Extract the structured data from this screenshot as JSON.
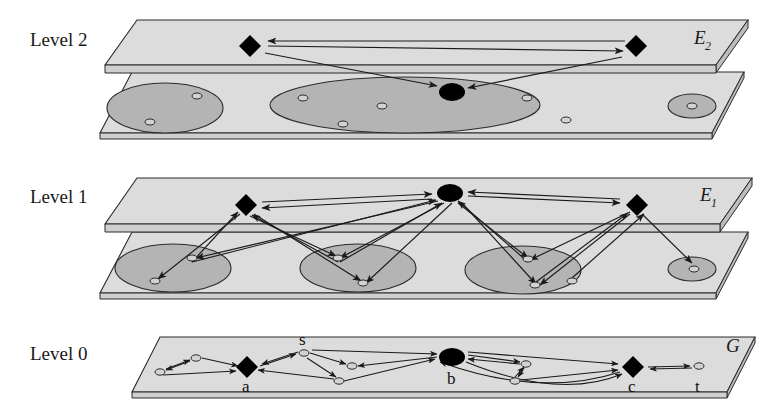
{
  "figure": {
    "kind": "hierarchical-graph-abstraction-diagram",
    "background": "#ffffff",
    "ink": "#1a1a1a"
  },
  "palette": {
    "plane_top": "#dcdcdc",
    "plane_side": "#bdbdbd",
    "plane_edge": "#2b2b2b",
    "cluster_fill": "#b4b4b4",
    "cluster_edge": "#2b2b2b",
    "node_fill": "#000000",
    "small_node_fill": "#d2d2d2",
    "arrow": "#1a1a1a"
  },
  "levels": [
    {
      "id": "level2",
      "label": "Level 2",
      "label_x": 30,
      "label_y": 46,
      "set_label": "E",
      "set_subscript": "2",
      "set_label_x": 694,
      "set_label_y": 44
    },
    {
      "id": "level1",
      "label": "Level 1",
      "label_x": 30,
      "label_y": 203,
      "set_label": "E",
      "set_subscript": "1",
      "set_label_x": 700,
      "set_label_y": 201
    },
    {
      "id": "level0",
      "label": "Level 0",
      "label_x": 30,
      "label_y": 360,
      "set_label": "G",
      "set_subscript": "",
      "set_label_x": 726,
      "set_label_y": 352
    }
  ],
  "node_labels": [
    {
      "text": "a",
      "x": 247,
      "y": 389
    },
    {
      "text": "s",
      "x": 303,
      "y": 340
    },
    {
      "text": "b",
      "x": 452,
      "y": 389
    },
    {
      "text": "c",
      "x": 633,
      "y": 389
    },
    {
      "text": "t",
      "x": 699,
      "y": 389
    }
  ],
  "level2_upper_nodes": [
    {
      "shape": "diamond",
      "x": 250,
      "y": 46,
      "r": 11
    },
    {
      "shape": "diamond",
      "x": 636,
      "y": 46,
      "r": 11
    }
  ],
  "level2_lower_clusters": [
    {
      "cx": 165,
      "cy": 108,
      "rx": 58,
      "ry": 25,
      "nodes": [
        {
          "x": 150,
          "y": 122
        },
        {
          "x": 197,
          "y": 96
        }
      ]
    },
    {
      "cx": 405,
      "cy": 105,
      "rx": 135,
      "ry": 28,
      "nodes": [
        {
          "x": 303,
          "y": 98
        },
        {
          "x": 382,
          "y": 106
        },
        {
          "x": 343,
          "y": 124
        },
        {
          "x": 527,
          "y": 98
        },
        {
          "x": 566,
          "y": 120
        }
      ]
    },
    {
      "cx": 692,
      "cy": 106,
      "rx": 24,
      "ry": 12,
      "nodes": [
        {
          "x": 692,
          "y": 106
        }
      ]
    }
  ],
  "level2_big_node": {
    "shape": "ellipse",
    "cx": 452,
    "cy": 92,
    "rx": 13,
    "ry": 9
  },
  "level1_upper_nodes": [
    {
      "shape": "diamond",
      "x": 246,
      "y": 205,
      "r": 11
    },
    {
      "shape": "ellipse",
      "x": 450,
      "y": 193,
      "rx": 13,
      "ry": 9
    },
    {
      "shape": "diamond",
      "x": 637,
      "y": 205,
      "r": 11
    }
  ],
  "level1_lower_clusters": [
    {
      "cx": 173,
      "cy": 268,
      "rx": 58,
      "ry": 24,
      "nodes": [
        {
          "x": 155,
          "y": 281
        },
        {
          "x": 192,
          "y": 258
        }
      ]
    },
    {
      "cx": 358,
      "cy": 268,
      "rx": 58,
      "ry": 24,
      "nodes": [
        {
          "x": 338,
          "y": 258
        },
        {
          "x": 363,
          "y": 283
        }
      ]
    },
    {
      "cx": 523,
      "cy": 270,
      "rx": 58,
      "ry": 24,
      "nodes": [
        {
          "x": 528,
          "y": 259
        },
        {
          "x": 535,
          "y": 285
        },
        {
          "x": 572,
          "y": 281
        }
      ]
    },
    {
      "cx": 692,
      "cy": 269,
      "rx": 24,
      "ry": 12,
      "nodes": [
        {
          "x": 694,
          "y": 269
        }
      ]
    }
  ],
  "level0_nodes": [
    {
      "id": "n1",
      "shape": "small",
      "x": 160,
      "y": 372
    },
    {
      "id": "n2",
      "shape": "small",
      "x": 196,
      "y": 358
    },
    {
      "id": "a",
      "shape": "diamond",
      "x": 247,
      "y": 368
    },
    {
      "id": "s",
      "shape": "small",
      "x": 304,
      "y": 353
    },
    {
      "id": "n3",
      "shape": "small",
      "x": 352,
      "y": 366
    },
    {
      "id": "n4",
      "shape": "small",
      "x": 339,
      "y": 381
    },
    {
      "id": "b",
      "shape": "ellipse",
      "x": 452,
      "y": 357
    },
    {
      "id": "n5",
      "shape": "small",
      "x": 526,
      "y": 364
    },
    {
      "id": "n6",
      "shape": "small",
      "x": 515,
      "y": 381
    },
    {
      "id": "c",
      "shape": "diamond",
      "x": 633,
      "y": 367
    },
    {
      "id": "t",
      "shape": "small",
      "x": 699,
      "y": 366
    }
  ],
  "counts": {
    "levels": 3,
    "level2_clusters": 3,
    "level1_clusters": 4,
    "level0_nodes": 11
  }
}
